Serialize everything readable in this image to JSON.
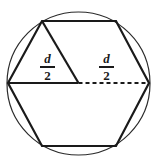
{
  "figure": {
    "background_color": "#ffffff",
    "stroke_color": "#1a1a1a",
    "circle_stroke_color": "#2b2b2b",
    "line_width": 2,
    "circle_line_width": 1,
    "dash_pattern": "4 3"
  },
  "circle": {
    "name": "circumscribed-circle",
    "cx": 78.5,
    "cy": 83.5,
    "r": 71.5
  },
  "hexagon": {
    "name": "inscribed-regular-hexagon",
    "vertices": [
      {
        "label": "left",
        "x": 8,
        "y": 83
      },
      {
        "label": "top-left",
        "x": 42,
        "y": 21
      },
      {
        "label": "top-right",
        "x": 116,
        "y": 21
      },
      {
        "label": "right",
        "x": 149,
        "y": 83
      },
      {
        "label": "bottom-right",
        "x": 116,
        "y": 146
      },
      {
        "label": "bottom-left",
        "x": 42,
        "y": 146
      }
    ],
    "points_attr": "8,83 42,21 116,21 149,83 116,146 42,146"
  },
  "segments": {
    "radius_left": {
      "name": "solid-radius-left",
      "style": "solid",
      "x1": 8,
      "y1": 83,
      "x2": 78.5,
      "y2": 83
    },
    "radius_right": {
      "name": "dashed-radius-right",
      "style": "dashed",
      "x1": 78.5,
      "y1": 83,
      "x2": 149,
      "y2": 83
    },
    "diagonal": {
      "name": "triangle-diagonal",
      "style": "solid",
      "x1": 42,
      "y1": 21,
      "x2": 78.5,
      "y2": 83
    }
  },
  "labels": {
    "left": {
      "name": "label-d-over-2-left",
      "numerator": "d",
      "denominator": "2",
      "text": "d/2"
    },
    "right": {
      "name": "label-d-over-2-right",
      "numerator": "d",
      "denominator": "2",
      "text": "d/2"
    }
  }
}
